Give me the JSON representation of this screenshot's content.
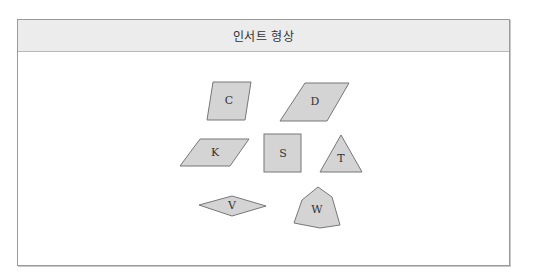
{
  "header": {
    "title": "인서트 형상"
  },
  "shapes": [
    {
      "label": "C",
      "type": "parallelogram"
    },
    {
      "label": "D",
      "type": "parallelogram"
    },
    {
      "label": "K",
      "type": "parallelogram"
    },
    {
      "label": "S",
      "type": "square"
    },
    {
      "label": "T",
      "type": "triangle"
    },
    {
      "label": "V",
      "type": "rhombus"
    },
    {
      "label": "W",
      "type": "trigon"
    }
  ],
  "colors": {
    "shape_fill": "#d4d4d4",
    "shape_stroke": "#777777",
    "header_bg": "#ececec",
    "border": "#9a9a9a"
  }
}
